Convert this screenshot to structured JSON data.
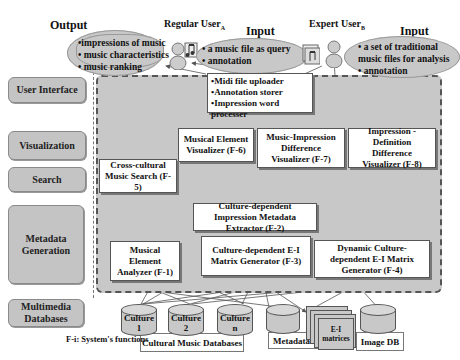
{
  "layers": [
    {
      "label": "User Interface"
    },
    {
      "label": "Visualization"
    },
    {
      "label": "Search"
    },
    {
      "label": "Metadata Generation"
    },
    {
      "label": "Multimedia Databases"
    }
  ],
  "top": {
    "output_heading": "Output",
    "output_items": [
      "•impressions of music",
      "• music characteristics",
      "• music ranking"
    ],
    "regular_user": {
      "name": "Regular User",
      "sub": "A"
    },
    "input_a_heading": "Input",
    "input_a_items": [
      "• a music file as query",
      "• annotation"
    ],
    "expert_user": {
      "name": "Expert User",
      "sub": "B"
    },
    "input_b_heading": "Input",
    "input_b_items": [
      "• a set of traditional",
      "music files for analysis",
      "• annotation"
    ]
  },
  "ui_box": {
    "items": [
      "•Midi file uploader",
      "•Annotation storer",
      "•Impression word processer"
    ]
  },
  "functions": {
    "f1": "Musical Element Analyzer (F-1)",
    "f2": "Culture-dependent Impression Metadata Extractor (F-2)",
    "f3": "Culture-dependent E-I Matrix Generator (F-3)",
    "f4": "Dynamic Culture-dependent E-I Matrix Generator (F-4)",
    "f5": "Cross-cultural Music Search (F-5)",
    "f6": "Musical Element Visualizer (F-6)",
    "f7": "Music-Impression Difference Visualizer (F-7)",
    "f8": "Impression - Definition Difference Visualizer (F-8)"
  },
  "databases": {
    "culture1": "Culture 1",
    "culture2": "Culture 2",
    "culturen": "Culture n",
    "cultural_label": "Cultural Music Databases",
    "metadata_label": "Metadata DB",
    "ei_label": "E-I matrices",
    "image_label": "Image DB"
  },
  "legend": "F-i: System's functions",
  "colors": {
    "region": "#c8c8c8",
    "box_border": "#555555",
    "layer": "#c4c4c4"
  }
}
